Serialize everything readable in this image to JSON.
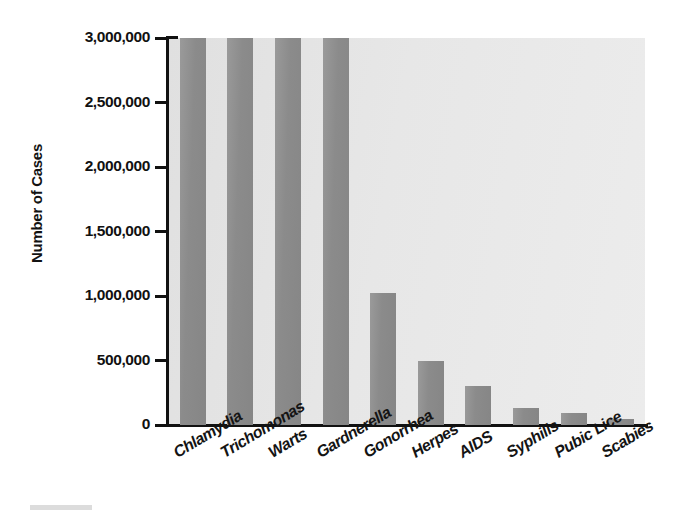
{
  "chart_data": {
    "type": "bar",
    "title": "",
    "xlabel": "",
    "ylabel": "Number of Cases",
    "ylim": [
      0,
      3000000
    ],
    "ytick_labels": [
      "3,000,000",
      "2,500,000",
      "2,000,000",
      "1,500,000",
      "1,000,000",
      "500,000",
      "0"
    ],
    "ytick_values": [
      3000000,
      2500000,
      2000000,
      1500000,
      1000000,
      500000,
      0
    ],
    "grid": false,
    "legend": "none",
    "bar_color": "#8e8e8e",
    "plot_background": "#e6e6e6",
    "axis_color": "#111111",
    "note": "first four bars are clipped at the top of the axis",
    "categories": [
      "Chlamydia",
      "Trichomonas",
      "Warts",
      "Gardnerella",
      "Gonorrhea",
      "Herpes",
      "AIDS",
      "Syphilis",
      "Pubic Lice",
      "Scabies"
    ],
    "values": [
      3000000,
      3000000,
      3000000,
      3000000,
      1020000,
      500000,
      300000,
      130000,
      95000,
      50000
    ]
  }
}
